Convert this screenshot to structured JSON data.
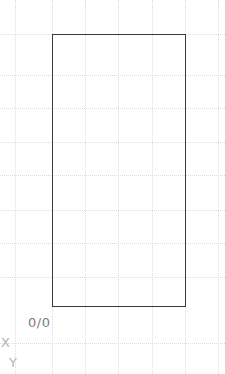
{
  "canvas": {
    "width": 225,
    "height": 374,
    "background": "#ffffff"
  },
  "grid": {
    "style": "dotted",
    "color": "#dcdcdc",
    "spacing_px": 33,
    "vertical_positions": [
      15,
      52,
      85,
      118,
      152,
      185,
      218
    ],
    "horizontal_positions": [
      34,
      75,
      108,
      142,
      175,
      210,
      243,
      277,
      343
    ]
  },
  "shapes": [
    {
      "type": "rectangle",
      "name": "drawing-rectangle",
      "x": 52,
      "y": 34,
      "width": 134,
      "height": 273,
      "stroke": "#3a3a3a",
      "stroke_width": 1.6,
      "fill": "none"
    }
  ],
  "labels": {
    "origin": {
      "text": "0/0",
      "x": 28,
      "y": 316,
      "color": "#7d7d7d"
    },
    "axis_x": {
      "text": "X",
      "x": 1,
      "y": 336,
      "color": "#b4b4b4"
    },
    "axis_y": {
      "text": "Y",
      "x": 9,
      "y": 356,
      "color": "#b4b4b4"
    }
  }
}
